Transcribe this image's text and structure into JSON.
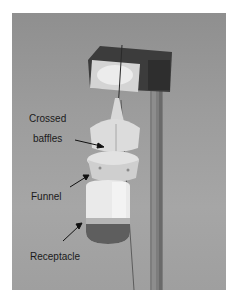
{
  "figure": {
    "type": "annotated-photograph",
    "labels": [
      {
        "id": "crossed-baffles",
        "lines": [
          "Crossed",
          "baffles"
        ]
      },
      {
        "id": "funnel",
        "lines": [
          "Funnel"
        ]
      },
      {
        "id": "receptacle",
        "lines": [
          "Receptacle"
        ]
      }
    ]
  }
}
